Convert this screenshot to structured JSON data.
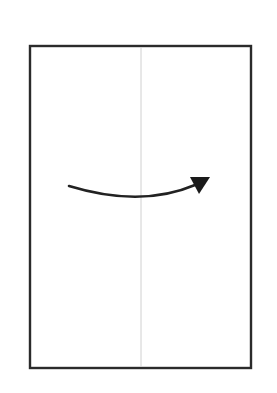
{
  "diagram": {
    "type": "fold-instruction",
    "colors": {
      "background": "#ffffff",
      "paper_border": "#2b2b2b",
      "crease_line": "#d0d0d0",
      "arrow": "#222222"
    },
    "paper": {
      "x": 30,
      "y": 46,
      "width": 221,
      "height": 322
    },
    "crease": {
      "x": 141,
      "y1": 47,
      "y2": 367,
      "orientation": "vertical"
    },
    "arrow": {
      "direction": "left-to-right",
      "path": "M 69 186 Q 141 208 195 185",
      "head": "190,177 210,177 199,194"
    }
  }
}
